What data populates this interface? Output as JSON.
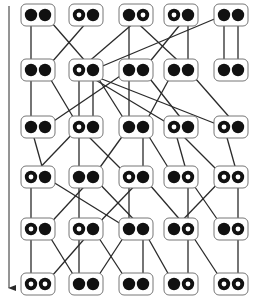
{
  "diagram": {
    "width": 257,
    "height": 302,
    "colors": {
      "stroke": "#2a2a2a",
      "fill": "#111111",
      "box": "#777777",
      "ring_inner": "#ffffff"
    },
    "time_arrow": {
      "x": 9,
      "y1": 6,
      "y2": 296,
      "direction": "down"
    },
    "columns": [
      38,
      86,
      136,
      181,
      231
    ],
    "rows": [
      15,
      70,
      127,
      177,
      229,
      284
    ],
    "pair_offset": 7,
    "box": {
      "width": 34,
      "height": 22,
      "radius": 5
    },
    "node_states": [
      [
        "FF",
        "OF",
        "FO",
        "OF",
        "FF"
      ],
      [
        "FF",
        "OF",
        "FF",
        "FF",
        "FF"
      ],
      [
        "FF",
        "OF",
        "FF",
        "OF",
        "OF"
      ],
      [
        "OF",
        "FF",
        "OF",
        "FO",
        "OO"
      ],
      [
        "OF",
        "OF",
        "FF",
        "FO",
        "FO"
      ],
      [
        "OO",
        "FF",
        "FF",
        "FO",
        "OO"
      ]
    ],
    "edges": [
      [
        0,
        0,
        "L",
        0,
        "L"
      ],
      [
        0,
        0,
        "R",
        1,
        "R"
      ],
      [
        0,
        1,
        "R",
        0,
        "R"
      ],
      [
        0,
        2,
        "L",
        2,
        "L"
      ],
      [
        0,
        2,
        "L",
        3,
        "R"
      ],
      [
        0,
        2,
        "R",
        1,
        "L"
      ],
      [
        0,
        3,
        "R",
        3,
        "R"
      ],
      [
        0,
        3,
        "R",
        2,
        "R"
      ],
      [
        0,
        4,
        "L",
        4,
        "L"
      ],
      [
        0,
        4,
        "R",
        4,
        "R"
      ],
      [
        0,
        4,
        "L",
        1,
        "R"
      ],
      [
        1,
        0,
        "L",
        0,
        "L"
      ],
      [
        1,
        0,
        "R",
        1,
        "L"
      ],
      [
        1,
        1,
        "L",
        1,
        "L"
      ],
      [
        1,
        1,
        "L",
        3,
        "L"
      ],
      [
        1,
        1,
        "L",
        4,
        "L"
      ],
      [
        1,
        1,
        "R",
        2,
        "L"
      ],
      [
        1,
        2,
        "L",
        2,
        "L"
      ],
      [
        1,
        2,
        "R",
        3,
        "R"
      ],
      [
        1,
        2,
        "L",
        0,
        "R"
      ],
      [
        1,
        3,
        "L",
        2,
        "R"
      ],
      [
        1,
        3,
        "R",
        4,
        "R"
      ],
      [
        1,
        1,
        "R",
        1,
        "R"
      ],
      [
        2,
        0,
        "L",
        0,
        "R"
      ],
      [
        2,
        1,
        "L",
        0,
        "L"
      ],
      [
        2,
        1,
        "L",
        1,
        "L"
      ],
      [
        2,
        1,
        "L",
        2,
        "L"
      ],
      [
        2,
        2,
        "L",
        1,
        "R"
      ],
      [
        2,
        2,
        "R",
        2,
        "R"
      ],
      [
        2,
        2,
        "R",
        3,
        "L"
      ],
      [
        2,
        3,
        "L",
        3,
        "R"
      ],
      [
        2,
        3,
        "L",
        4,
        "L"
      ],
      [
        2,
        4,
        "L",
        4,
        "R"
      ],
      [
        3,
        0,
        "L",
        0,
        "L"
      ],
      [
        3,
        0,
        "R",
        2,
        "L"
      ],
      [
        3,
        1,
        "L",
        1,
        "L"
      ],
      [
        3,
        1,
        "R",
        0,
        "R"
      ],
      [
        3,
        1,
        "R",
        2,
        "R"
      ],
      [
        3,
        2,
        "R",
        1,
        "R"
      ],
      [
        3,
        2,
        "R",
        3,
        "R"
      ],
      [
        3,
        2,
        "L",
        2,
        "L"
      ],
      [
        3,
        3,
        "R",
        3,
        "R"
      ],
      [
        3,
        3,
        "R",
        4,
        "L"
      ],
      [
        3,
        4,
        "R",
        4,
        "R"
      ],
      [
        3,
        4,
        "L",
        3,
        "L"
      ],
      [
        4,
        0,
        "L",
        0,
        "L"
      ],
      [
        4,
        0,
        "R",
        1,
        "L"
      ],
      [
        4,
        1,
        "L",
        1,
        "L"
      ],
      [
        4,
        1,
        "R",
        0,
        "R"
      ],
      [
        4,
        1,
        "R",
        2,
        "L"
      ],
      [
        4,
        2,
        "L",
        1,
        "R"
      ],
      [
        4,
        2,
        "R",
        2,
        "R"
      ],
      [
        4,
        2,
        "R",
        3,
        "L"
      ],
      [
        4,
        3,
        "R",
        3,
        "R"
      ],
      [
        4,
        3,
        "R",
        4,
        "L"
      ],
      [
        4,
        4,
        "R",
        4,
        "R"
      ]
    ]
  }
}
